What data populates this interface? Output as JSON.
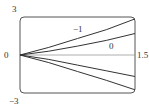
{
  "chart_data": {
    "type": "line",
    "title": "",
    "xlabel": "",
    "ylabel": "",
    "xlim": [
      0,
      1.5
    ],
    "ylim": [
      -3,
      3
    ],
    "grid": false,
    "legend": "none",
    "tick_labels": {
      "x_origin": "0",
      "x_max": "1.5",
      "y_max": "3",
      "y_min": "-3"
    },
    "annotations": [
      {
        "text": "−1",
        "x": 0.7,
        "y": 1.9
      },
      {
        "text": "0",
        "x": 1.0,
        "y": 0.55
      }
    ],
    "series": [
      {
        "name": "curve-1",
        "x": [
          0,
          0.375,
          0.75,
          1.125,
          1.5
        ],
        "y": [
          0,
          0.6,
          1.3,
          2.0,
          2.85
        ]
      },
      {
        "name": "curve-2",
        "x": [
          0,
          0.375,
          0.75,
          1.125,
          1.5
        ],
        "y": [
          0,
          0.3,
          0.7,
          1.15,
          1.7
        ]
      },
      {
        "name": "curve-3",
        "x": [
          0,
          0.375,
          0.75,
          1.125,
          1.5
        ],
        "y": [
          0,
          -0.35,
          -0.8,
          -1.25,
          -1.7
        ]
      },
      {
        "name": "curve-4",
        "x": [
          0,
          0.375,
          0.75,
          1.125,
          1.5
        ],
        "y": [
          0,
          -0.6,
          -1.3,
          -2.0,
          -2.75
        ]
      }
    ],
    "colors": {
      "line": "#333333",
      "frame": "#555555",
      "axis": "#888888"
    }
  },
  "labels": {
    "y_max": "3",
    "y_min": "−3",
    "x_origin": "0",
    "x_max": "1.5",
    "curve_label_a": "−1",
    "curve_label_b": "0"
  }
}
